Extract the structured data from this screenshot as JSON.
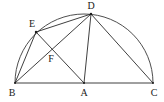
{
  "diagram": {
    "type": "geometry-semicircle",
    "colors": {
      "stroke": "#2a2a2a",
      "background": "#ffffff",
      "label": "#1a1a1a"
    },
    "points": {
      "B": {
        "label": "B",
        "x": 15,
        "y": 83,
        "lx": 12,
        "ly": 96
      },
      "A": {
        "label": "A",
        "x": 84,
        "y": 83,
        "lx": 84,
        "ly": 96
      },
      "C": {
        "label": "C",
        "x": 153,
        "y": 83,
        "lx": 154,
        "ly": 96
      },
      "D": {
        "label": "D",
        "x": 91,
        "y": 14,
        "lx": 91,
        "ly": 9
      },
      "E": {
        "label": "E",
        "x": 36,
        "y": 32,
        "lx": 32,
        "ly": 27
      },
      "F": {
        "label": "F",
        "x": 52,
        "y": 50,
        "lx": 51,
        "ly": 62
      }
    },
    "segments": [
      [
        "B",
        "C"
      ],
      [
        "B",
        "E"
      ],
      [
        "E",
        "D"
      ],
      [
        "B",
        "D"
      ],
      [
        "E",
        "A"
      ],
      [
        "A",
        "D"
      ],
      [
        "D",
        "C"
      ]
    ],
    "arc": {
      "from": "B",
      "to": "C",
      "center": "A",
      "radius": 69
    }
  }
}
